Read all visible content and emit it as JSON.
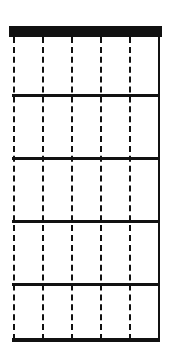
{
  "diagram": {
    "type": "guitar-chord-diagram",
    "state": "blank",
    "strings": 6,
    "frets": 5,
    "colors": {
      "line": "#111111",
      "background": "#ffffff"
    }
  },
  "layout": {
    "string_x": [
      13,
      42,
      71,
      100,
      129,
      158
    ],
    "string_styles": [
      "dashed",
      "dashed",
      "dashed",
      "dashed",
      "dashed",
      "solid"
    ],
    "fret_y": [
      94,
      157,
      220,
      283,
      338
    ]
  }
}
